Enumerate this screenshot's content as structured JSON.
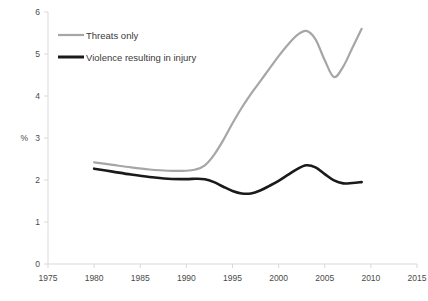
{
  "chart_data": {
    "type": "line",
    "title": "",
    "subtitle": "",
    "xlabel": "",
    "ylabel": "%",
    "xlim": [
      1975,
      2015
    ],
    "ylim": [
      0,
      6
    ],
    "xticks": [
      1975,
      1980,
      1985,
      1990,
      1995,
      2000,
      2005,
      2010,
      2015
    ],
    "yticks": [
      0,
      1,
      2,
      3,
      4,
      5,
      6
    ],
    "xtick_labels": [
      "1975",
      "1980",
      "1985",
      "1990",
      "1995",
      "2000",
      "2005",
      "2010",
      "2015"
    ],
    "ytick_labels": [
      "0",
      "1",
      "2",
      "3",
      "4",
      "5",
      "6"
    ],
    "grid": false,
    "legend_position": "top-left-inside",
    "series": [
      {
        "name": "Threats only",
        "color": "#a6a6a6",
        "width": 2.2,
        "x": [
          1980,
          1982,
          1984,
          1986,
          1988,
          1990,
          1991,
          1992,
          1993,
          1994,
          1995,
          1996,
          1997,
          1998,
          1999,
          2000,
          2001,
          2002,
          2003,
          2004,
          2005,
          2006,
          2007,
          2008,
          2009
        ],
        "values": [
          2.42,
          2.36,
          2.3,
          2.25,
          2.22,
          2.22,
          2.25,
          2.35,
          2.6,
          2.95,
          3.35,
          3.72,
          4.05,
          4.35,
          4.65,
          4.95,
          5.22,
          5.45,
          5.55,
          5.35,
          4.85,
          4.45,
          4.7,
          5.15,
          5.6
        ]
      },
      {
        "name": "Violence resulting in injury",
        "color": "#1a1a1a",
        "width": 2.6,
        "x": [
          1980,
          1982,
          1984,
          1986,
          1988,
          1990,
          1991,
          1992,
          1993,
          1994,
          1995,
          1996,
          1997,
          1998,
          1999,
          2000,
          2001,
          2002,
          2003,
          2004,
          2005,
          2006,
          2007,
          2008,
          2009
        ],
        "values": [
          2.27,
          2.2,
          2.13,
          2.07,
          2.03,
          2.02,
          2.03,
          2.02,
          1.95,
          1.84,
          1.74,
          1.68,
          1.68,
          1.75,
          1.86,
          1.98,
          2.12,
          2.26,
          2.35,
          2.3,
          2.14,
          1.99,
          1.92,
          1.93,
          1.95
        ]
      }
    ],
    "legend": [
      {
        "label": "Threats only",
        "color": "#a6a6a6",
        "width": 2.2
      },
      {
        "label": "Violence resulting in injury",
        "color": "#1a1a1a",
        "width": 3.0
      }
    ]
  }
}
